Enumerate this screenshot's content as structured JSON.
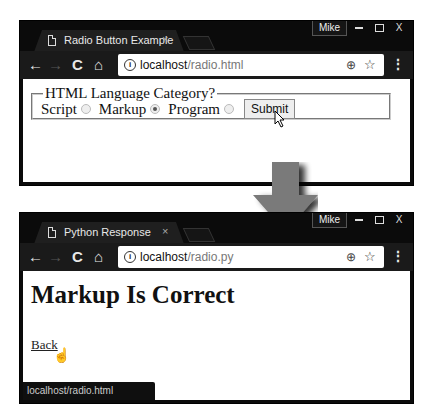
{
  "window1": {
    "tab_title": "Radio Button Example",
    "tab_close": "×",
    "user": "Mike",
    "url_host": "localhost",
    "url_path": "/radio.html",
    "form": {
      "legend": "HTML Language Category?",
      "options": [
        {
          "label": "Script",
          "checked": false
        },
        {
          "label": "Markup",
          "checked": true
        },
        {
          "label": "Program",
          "checked": false
        }
      ],
      "submit_label": "Submit"
    }
  },
  "window2": {
    "tab_title": "Python Response",
    "tab_close": "×",
    "user": "Mike",
    "url_host": "localhost",
    "url_path": "/radio.py",
    "heading": "Markup Is Correct",
    "link_label": "Back",
    "status_url": "localhost/radio.html"
  },
  "icons": {
    "back": "←",
    "forward": "→",
    "reload": "C",
    "home": "⌂",
    "info": "i",
    "zoom": "⊕",
    "star": "☆",
    "menu": "⋮",
    "close": "X",
    "hand_cursor": "☝"
  },
  "colors": {
    "chrome_frame": "#0b0b0b",
    "arrow": "#7a7a7a"
  }
}
